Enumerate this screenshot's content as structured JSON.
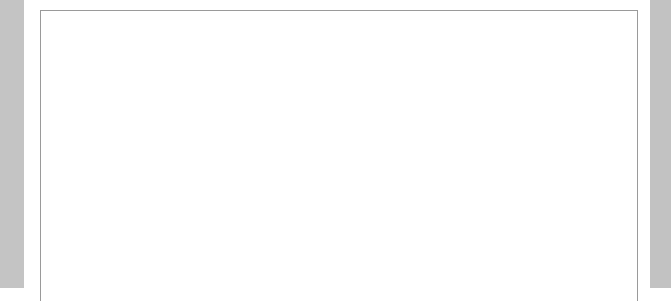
{
  "levels": [
    "Pre-1",
    "1",
    "2",
    "3"
  ],
  "rows": [
    {
      "label_lines": [
        "Mental",
        "mathematics"
      ],
      "activity": "What's Next?",
      "activity_caps": [
        [
          "W",
          "HAT"
        ],
        [
          "’S "
        ],
        [
          "N",
          "EXT?"
        ]
      ],
      "pages": "pp.2&3"
    },
    {
      "label_lines": [
        "Lines, cards",
        "and grids"
      ],
      "activity": "Number Cards",
      "pages": "pp.4&5"
    },
    {
      "label_lines": [
        "Calculators"
      ],
      "activity": "Calculator Count",
      "pages": "pp.6&7"
    },
    {
      "label_lines": [
        "Objects"
      ],
      "activity": "How Many?",
      "pages": "pp.8&9"
    },
    {
      "label_lines": [
        "Pencil",
        "and paper"
      ],
      "activity": "Tallying",
      "pages": "pp.10&11"
    }
  ],
  "colors": {
    "ink": "#111111",
    "grid": "#9a9a9a",
    "margin": "#c4c4c4"
  }
}
